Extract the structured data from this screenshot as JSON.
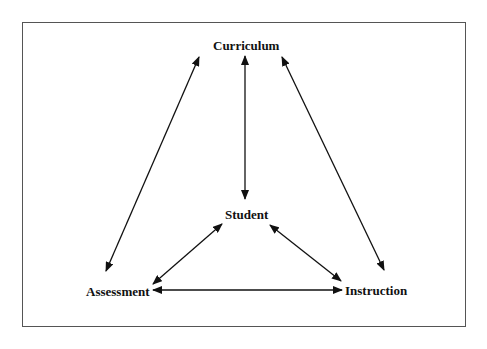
{
  "diagram": {
    "type": "relationship-diagram",
    "frame": {
      "border_color": "#555555"
    },
    "nodes": {
      "curriculum": {
        "label": "Curriculum"
      },
      "student": {
        "label": "Student"
      },
      "assessment": {
        "label": "Assessment"
      },
      "instruction": {
        "label": "Instruction"
      }
    },
    "edges": [
      {
        "from": "Curriculum",
        "to": "Assessment",
        "direction": "bidirectional"
      },
      {
        "from": "Curriculum",
        "to": "Student",
        "direction": "bidirectional"
      },
      {
        "from": "Curriculum",
        "to": "Instruction",
        "direction": "bidirectional"
      },
      {
        "from": "Student",
        "to": "Assessment",
        "direction": "bidirectional"
      },
      {
        "from": "Student",
        "to": "Instruction",
        "direction": "bidirectional"
      },
      {
        "from": "Assessment",
        "to": "Instruction",
        "direction": "bidirectional"
      }
    ],
    "colors": {
      "text": "#111111",
      "arrow": "#111111"
    }
  }
}
